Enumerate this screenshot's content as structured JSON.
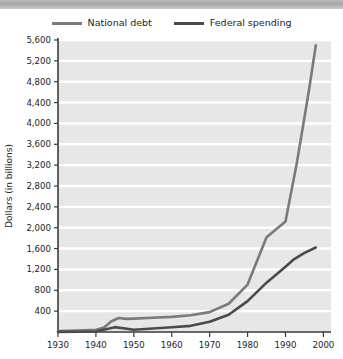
{
  "legend": {
    "items": [
      {
        "label": "National debt",
        "color": "#7a7a7a",
        "name": "national-debt"
      },
      {
        "label": "Federal spending",
        "color": "#4a4a4a",
        "name": "federal-spending"
      }
    ]
  },
  "axes": {
    "y_title": "Dollars (in billions)",
    "y_ticks": [
      "5,600",
      "5,200",
      "4,800",
      "4,400",
      "4,000",
      "3,600",
      "3,200",
      "2,800",
      "2,400",
      "2,000",
      "1,600",
      "1,200",
      "800",
      "400"
    ],
    "x_ticks": [
      "1930",
      "1940",
      "1950",
      "1960",
      "1970",
      "1980",
      "1990",
      "2000"
    ]
  },
  "style": {
    "plot_background": "#e7e7e7",
    "gridline_color": "#ffffff",
    "axis_color": "#3a3a3a",
    "header_bar_color": "#b0b0b0"
  },
  "chart_data": {
    "type": "line",
    "title": "",
    "xlabel": "",
    "ylabel": "Dollars (in billions)",
    "xlim": [
      1930,
      2002
    ],
    "ylim": [
      0,
      5600
    ],
    "grid": true,
    "legend_position": "top-center",
    "x_tick_values": [
      1930,
      1940,
      1950,
      1960,
      1970,
      1980,
      1990,
      2000
    ],
    "y_tick_values": [
      400,
      800,
      1200,
      1600,
      2000,
      2400,
      2800,
      3200,
      3600,
      4000,
      4400,
      4800,
      5200,
      5600
    ],
    "series": [
      {
        "name": "National debt",
        "color": "#7a7a7a",
        "x": [
          1930,
          1935,
          1940,
          1942,
          1944,
          1946,
          1948,
          1950,
          1955,
          1960,
          1965,
          1970,
          1975,
          1980,
          1985,
          1990,
          1993,
          1996,
          1998
        ],
        "values": [
          16,
          29,
          43,
          79,
          201,
          269,
          252,
          257,
          274,
          291,
          322,
          381,
          542,
          909,
          1817,
          2120,
          3248,
          4550,
          5500
        ]
      },
      {
        "name": "Federal spending",
        "color": "#4a4a4a",
        "x": [
          1930,
          1935,
          1940,
          1945,
          1950,
          1955,
          1960,
          1965,
          1970,
          1975,
          1980,
          1985,
          1990,
          1992,
          1995,
          1998
        ],
        "values": [
          3,
          6,
          9,
          93,
          43,
          68,
          92,
          118,
          196,
          332,
          591,
          946,
          1253,
          1382,
          1516,
          1620
        ]
      }
    ]
  }
}
